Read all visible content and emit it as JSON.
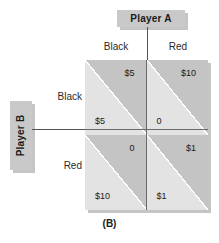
{
  "figure": {
    "caption": "(B)",
    "colors": {
      "upper_triangle": "#c4c4c4",
      "lower_triangle": "#e3e3e3",
      "header_box": "#c9c9c9",
      "line": "#555555",
      "text": "#1a1a1a",
      "background": "#ffffff"
    }
  },
  "players": {
    "column_player": {
      "name": "Player A",
      "strategies": [
        "Black",
        "Red"
      ]
    },
    "row_player": {
      "name": "Player B",
      "strategies": [
        "Black",
        "Red"
      ]
    }
  },
  "matrix": {
    "cells": [
      {
        "row": "Black",
        "column": "Black",
        "upper_payoff": "$5",
        "lower_payoff": "$5"
      },
      {
        "row": "Black",
        "column": "Red",
        "upper_payoff": "$10",
        "lower_payoff": "0"
      },
      {
        "row": "Red",
        "column": "Black",
        "upper_payoff": "0",
        "lower_payoff": "$10"
      },
      {
        "row": "Red",
        "column": "Red",
        "upper_payoff": "$1",
        "lower_payoff": "$1"
      }
    ]
  }
}
